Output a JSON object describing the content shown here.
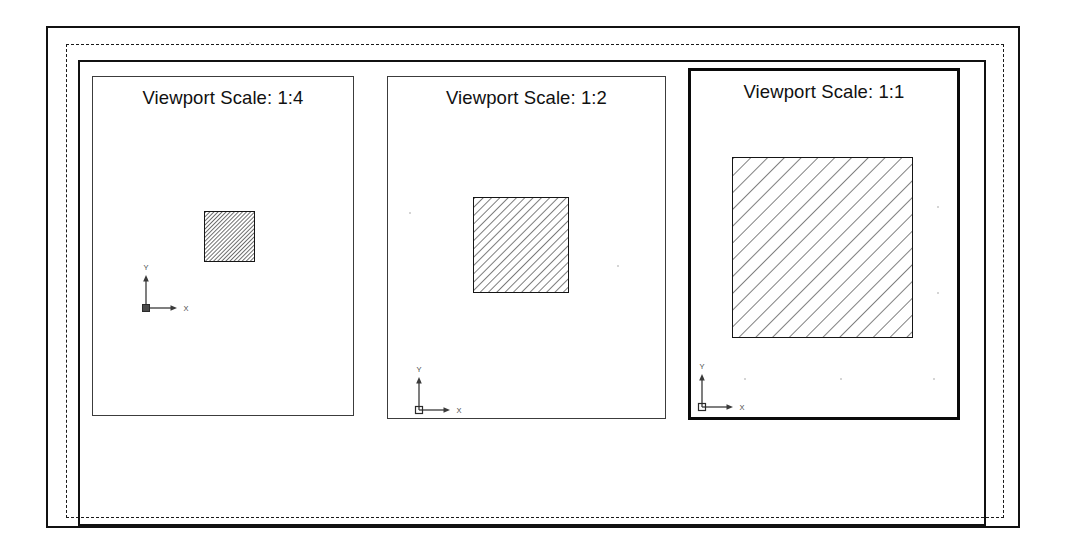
{
  "document": {
    "title": "Viewport Scale Comparison Layout",
    "background_color": "#ffffff",
    "line_color": "#111111"
  },
  "paper": {
    "sheet_name": "paper-sheet",
    "printable_area_name": "printable-area",
    "layout_border_name": "layout-border",
    "printable_area_style": "dashed"
  },
  "viewports": [
    {
      "id": "viewport-1",
      "label": "Viewport Scale: 1:4",
      "scale": "1:4",
      "scale_factor": 0.25,
      "active": false,
      "border_weight": "thin",
      "geometry": {
        "shape": "square",
        "hatch_pattern": "ANSI31",
        "hatch_angle_deg": 45,
        "hatch_spacing_px": 3,
        "size_px": 51
      },
      "ucs_icon": {
        "name": "ucs-icon",
        "x_label": "X",
        "y_label": "Y"
      }
    },
    {
      "id": "viewport-2",
      "label": "Viewport Scale: 1:2",
      "scale": "1:2",
      "scale_factor": 0.5,
      "active": false,
      "border_weight": "thin",
      "geometry": {
        "shape": "square",
        "hatch_pattern": "ANSI31",
        "hatch_angle_deg": 45,
        "hatch_spacing_px": 6,
        "size_px": 96
      },
      "ucs_icon": {
        "name": "ucs-icon",
        "x_label": "X",
        "y_label": "Y"
      }
    },
    {
      "id": "viewport-3",
      "label": "Viewport Scale: 1:1",
      "scale": "1:1",
      "scale_factor": 1.0,
      "active": true,
      "border_weight": "thick",
      "geometry": {
        "shape": "square",
        "hatch_pattern": "ANSI31",
        "hatch_angle_deg": 45,
        "hatch_spacing_px": 12,
        "size_px": 181
      },
      "ucs_icon": {
        "name": "ucs-icon",
        "x_label": "X",
        "y_label": "Y"
      }
    }
  ]
}
